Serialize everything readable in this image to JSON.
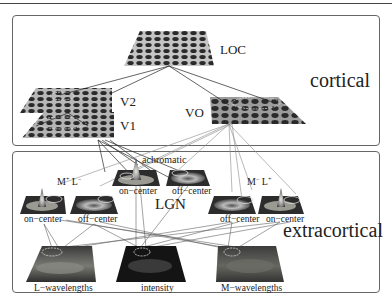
{
  "figure": {
    "panels": {
      "cortical": {
        "title": "cortical"
      },
      "extracortical": {
        "title": "extracortical"
      }
    },
    "cortical_areas": {
      "loc": "LOC",
      "v2": "V2",
      "v1": "V1",
      "vo": "VO"
    },
    "lgn": {
      "label": "LGN",
      "achromatic": {
        "label": "achromatic",
        "cells": [
          "on−center",
          "off−center"
        ]
      },
      "mplus_lminus": {
        "label_m": "M",
        "sup_m": "+",
        "label_l": "L",
        "sup_l": "−",
        "cells": [
          "on−center",
          "off−center"
        ]
      },
      "mminus_lplus": {
        "label_m": "M",
        "sup_m": "−",
        "label_l": "L",
        "sup_l": "+",
        "cells": [
          "off−center",
          "on−center"
        ]
      }
    },
    "inputs": [
      "L−wavelengths",
      "intensity",
      "M−wavelengths"
    ],
    "colors": {
      "grid_bg": "#b8b8b8",
      "dot": "#2a2a2a",
      "panel_border": "#666666",
      "line_dark": "#222222",
      "line_light": "#8a8a8a",
      "image_dark": "#141414",
      "image_mid": "#4a4a4a"
    }
  }
}
